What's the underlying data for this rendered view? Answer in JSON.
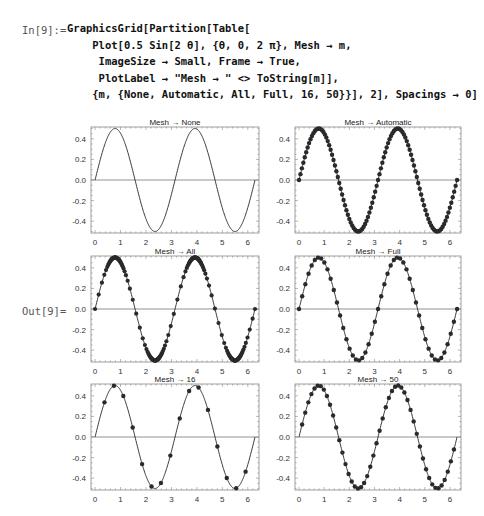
{
  "notebook": {
    "input_label": "In[9]:=",
    "output_label": "Out[9]=",
    "code_lines": [
      "GraphicsGrid[Partition[Table[",
      "    Plot[0.5 Sin[2 θ], {θ, 0, 2 π}, Mesh → m,",
      "     ImageSize → Small, Frame → True,",
      "     PlotLabel → \"Mesh → \" <> ToString[m]],",
      "    {m, {None, Automatic, All, Full, 16, 50}}], 2], Spacings → 0]"
    ]
  },
  "chart_data": [
    {
      "type": "line",
      "title": "Mesh → None",
      "function": "0.5 Sin[2 θ]",
      "x_range": [
        0,
        6.2832
      ],
      "xticks": [
        0,
        1,
        2,
        3,
        4,
        5,
        6
      ],
      "yticks": [
        0.4,
        0.2,
        0.0,
        -0.2,
        -0.4
      ],
      "ytick_labels": [
        "0.4",
        "0.2",
        "0.0",
        "-0.2",
        "-0.4"
      ],
      "ylim": [
        -0.5,
        0.5
      ],
      "mesh": "None",
      "mesh_points": 0,
      "frame": true
    },
    {
      "type": "line",
      "title": "Mesh → Automatic",
      "function": "0.5 Sin[2 θ]",
      "x_range": [
        0,
        6.2832
      ],
      "xticks": [
        0,
        1,
        2,
        3,
        4,
        5,
        6
      ],
      "yticks": [
        0.4,
        0.2,
        0.0,
        -0.2,
        -0.4
      ],
      "ytick_labels": [
        "0.4",
        "0.2",
        "0.0",
        "-0.2",
        "-0.4"
      ],
      "ylim": [
        -0.5,
        0.5
      ],
      "mesh": "Automatic",
      "mesh_points": 110,
      "frame": true
    },
    {
      "type": "line",
      "title": "Mesh → All",
      "function": "0.5 Sin[2 θ]",
      "x_range": [
        0,
        6.2832
      ],
      "xticks": [
        0,
        1,
        2,
        3,
        4,
        5,
        6
      ],
      "yticks": [
        0.4,
        0.2,
        0.0,
        -0.2,
        -0.4
      ],
      "ytick_labels": [
        "0.4",
        "0.2",
        "0.0",
        "-0.2",
        "-0.4"
      ],
      "ylim": [
        -0.5,
        0.5
      ],
      "mesh": "All",
      "mesh_points": "adaptive",
      "frame": true
    },
    {
      "type": "line",
      "title": "Mesh → Full",
      "function": "0.5 Sin[2 θ]",
      "x_range": [
        0,
        6.2832
      ],
      "xticks": [
        0,
        1,
        2,
        3,
        4,
        5,
        6
      ],
      "yticks": [
        0.4,
        0.2,
        0.0,
        -0.2,
        -0.4
      ],
      "ytick_labels": [
        "0.4",
        "0.2",
        "0.0",
        "-0.2",
        "-0.4"
      ],
      "ylim": [
        -0.5,
        0.5
      ],
      "mesh": "Full",
      "mesh_points": 50,
      "frame": true
    },
    {
      "type": "line",
      "title": "Mesh → 16",
      "function": "0.5 Sin[2 θ]",
      "x_range": [
        0,
        6.2832
      ],
      "xticks": [
        0,
        1,
        2,
        3,
        4,
        5,
        6
      ],
      "yticks": [
        0.4,
        0.2,
        0.0,
        -0.2,
        -0.4
      ],
      "ytick_labels": [
        "0.4",
        "0.2",
        "0.0",
        "-0.2",
        "-0.4"
      ],
      "ylim": [
        -0.5,
        0.5
      ],
      "mesh": "16",
      "mesh_points": 16,
      "frame": true
    },
    {
      "type": "line",
      "title": "Mesh → 50",
      "function": "0.5 Sin[2 θ]",
      "x_range": [
        0,
        6.2832
      ],
      "xticks": [
        0,
        1,
        2,
        3,
        4,
        5,
        6
      ],
      "yticks": [
        0.4,
        0.2,
        0.0,
        -0.2,
        -0.4
      ],
      "ytick_labels": [
        "0.4",
        "0.2",
        "0.0",
        "-0.2",
        "-0.4"
      ],
      "ylim": [
        -0.5,
        0.5
      ],
      "mesh": "50",
      "mesh_points": 50,
      "frame": true
    }
  ],
  "colors": {
    "curve": "#222222",
    "axis": "#777777",
    "frame": "#888888",
    "mesh_point": "#2a2a2a"
  }
}
